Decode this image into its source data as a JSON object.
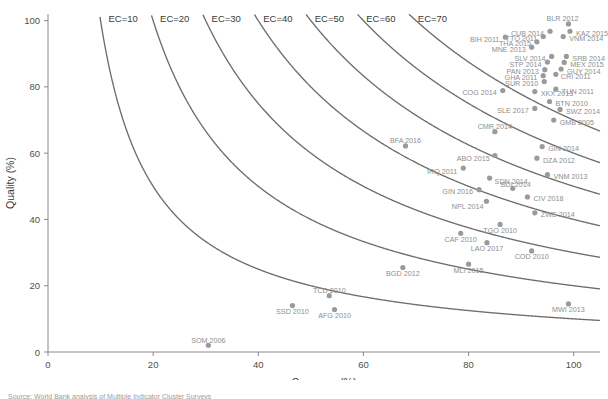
{
  "chart_data": {
    "type": "scatter",
    "title": "",
    "xlabel": "Coverage (%)",
    "ylabel": "Quality (%)",
    "xlim": [
      0,
      105
    ],
    "ylim": [
      0,
      102
    ],
    "xticks": [
      0,
      20,
      40,
      60,
      80,
      100
    ],
    "yticks": [
      0,
      20,
      40,
      60,
      80,
      100
    ],
    "grid": false,
    "legend": "none",
    "curves": {
      "label_prefix": "EC=",
      "formula": "Coverage * Quality = EC * 100",
      "levels": [
        10,
        20,
        30,
        40,
        50,
        60,
        70
      ],
      "labels": [
        "EC=10",
        "EC=20",
        "EC=30",
        "EC=40",
        "EC=50",
        "EC=60",
        "EC=70"
      ]
    },
    "points": [
      {
        "label": "BLR 2012",
        "x": 99.0,
        "y": 99.0,
        "lx": -6,
        "ly": -5,
        "anchor": "middle"
      },
      {
        "label": "KAZ 2015",
        "x": 99.3,
        "y": 96.8,
        "lx": 6,
        "ly": 2,
        "anchor": "start"
      },
      {
        "label": "CUB 2014",
        "x": 95.5,
        "y": 96.8,
        "lx": -6,
        "ly": 2,
        "anchor": "end"
      },
      {
        "label": "TTO 2011",
        "x": 94.2,
        "y": 95.2,
        "lx": -6,
        "ly": 2,
        "anchor": "end"
      },
      {
        "label": "THA 2015",
        "x": 93.0,
        "y": 93.6,
        "lx": -6,
        "ly": 2,
        "anchor": "end"
      },
      {
        "label": "VNM 2014",
        "x": 98.0,
        "y": 95.2,
        "lx": 6,
        "ly": 2,
        "anchor": "start"
      },
      {
        "label": "MNE 2013",
        "x": 92.0,
        "y": 92.0,
        "lx": -6,
        "ly": 2,
        "anchor": "end"
      },
      {
        "label": "BIH 2011",
        "x": 87.0,
        "y": 95.0,
        "lx": -6,
        "ly": 2,
        "anchor": "end"
      },
      {
        "label": "SLV 2014",
        "x": 95.8,
        "y": 89.2,
        "lx": -6,
        "ly": 2,
        "anchor": "end"
      },
      {
        "label": "SRB 2014",
        "x": 98.6,
        "y": 89.2,
        "lx": 6,
        "ly": 2,
        "anchor": "start"
      },
      {
        "label": "STP 2014",
        "x": 95.0,
        "y": 87.5,
        "lx": -6,
        "ly": 2,
        "anchor": "end"
      },
      {
        "label": "MEX 2015",
        "x": 98.2,
        "y": 87.4,
        "lx": 6,
        "ly": 2,
        "anchor": "start"
      },
      {
        "label": "PAN 2013",
        "x": 94.5,
        "y": 85.2,
        "lx": -6,
        "ly": 2,
        "anchor": "end"
      },
      {
        "label": "GUY 2014",
        "x": 97.6,
        "y": 85.4,
        "lx": 6,
        "ly": 2,
        "anchor": "start"
      },
      {
        "label": "GHA 2011",
        "x": 94.2,
        "y": 83.4,
        "lx": -6,
        "ly": 2,
        "anchor": "end"
      },
      {
        "label": "CRI 2011",
        "x": 96.6,
        "y": 83.8,
        "lx": 5,
        "ly": 2,
        "anchor": "start"
      },
      {
        "label": "SUR 2010",
        "x": 94.4,
        "y": 81.6,
        "lx": -6,
        "ly": 2,
        "anchor": "end"
      },
      {
        "label": "TUN 2011",
        "x": 96.6,
        "y": 79.3,
        "lx": 6,
        "ly": 2,
        "anchor": "start"
      },
      {
        "label": "COG 2014",
        "x": 86.5,
        "y": 78.9,
        "lx": -6,
        "ly": 2,
        "anchor": "end"
      },
      {
        "label": "XKX 2013",
        "x": 92.6,
        "y": 78.6,
        "lx": 6,
        "ly": 2,
        "anchor": "start"
      },
      {
        "label": "BTN 2010",
        "x": 95.4,
        "y": 75.6,
        "lx": 6,
        "ly": 2,
        "anchor": "start"
      },
      {
        "label": "SLE 2017",
        "x": 92.6,
        "y": 73.5,
        "lx": -6,
        "ly": 2,
        "anchor": "end"
      },
      {
        "label": "SWZ 2014",
        "x": 97.4,
        "y": 73.2,
        "lx": 6,
        "ly": 2,
        "anchor": "start"
      },
      {
        "label": "GMB 2005",
        "x": 96.2,
        "y": 70.0,
        "lx": 6,
        "ly": 2,
        "anchor": "start"
      },
      {
        "label": "CMR 2014",
        "x": 85.0,
        "y": 66.5,
        "lx": 0,
        "ly": -5,
        "anchor": "middle"
      },
      {
        "label": "GIN 2014",
        "x": 94.0,
        "y": 62.0,
        "lx": 6,
        "ly": 2,
        "anchor": "start"
      },
      {
        "label": "BFA 2016",
        "x": 68.0,
        "y": 62.2,
        "lx": 0,
        "ly": -5,
        "anchor": "middle"
      },
      {
        "label": "ABO 2015",
        "x": 85.0,
        "y": 59.3,
        "lx": -5,
        "ly": 3,
        "anchor": "end"
      },
      {
        "label": "DZA 2012",
        "x": 93.0,
        "y": 58.5,
        "lx": 6,
        "ly": 2,
        "anchor": "start"
      },
      {
        "label": "IRQ 2011",
        "x": 79.0,
        "y": 55.5,
        "lx": -6,
        "ly": 3,
        "anchor": "end"
      },
      {
        "label": "SDN 2014",
        "x": 84.0,
        "y": 52.5,
        "lx": 5,
        "ly": 3,
        "anchor": "start"
      },
      {
        "label": "VNM 2013",
        "x": 95.0,
        "y": 53.5,
        "lx": 6,
        "ly": 2,
        "anchor": "start"
      },
      {
        "label": "GIN 2016",
        "x": 82.0,
        "y": 49.0,
        "lx": -6,
        "ly": 2,
        "anchor": "end"
      },
      {
        "label": "BDI 2014",
        "x": 88.4,
        "y": 49.4,
        "lx": 3,
        "ly": -4,
        "anchor": "middle"
      },
      {
        "label": "CIV 2018",
        "x": 91.2,
        "y": 46.8,
        "lx": 6,
        "ly": 2,
        "anchor": "start"
      },
      {
        "label": "NPL 2014",
        "x": 83.4,
        "y": 45.5,
        "lx": -3,
        "ly": 5,
        "anchor": "end"
      },
      {
        "label": "ZWE 2014",
        "x": 92.6,
        "y": 42.0,
        "lx": 6,
        "ly": 2,
        "anchor": "start"
      },
      {
        "label": "TGO 2010",
        "x": 86.0,
        "y": 38.5,
        "lx": 0,
        "ly": 6,
        "anchor": "middle"
      },
      {
        "label": "CAF 2010",
        "x": 78.5,
        "y": 35.8,
        "lx": 0,
        "ly": 6,
        "anchor": "middle"
      },
      {
        "label": "LAO 2017",
        "x": 83.5,
        "y": 33.0,
        "lx": 0,
        "ly": 6,
        "anchor": "middle"
      },
      {
        "label": "COD 2010",
        "x": 92.0,
        "y": 30.5,
        "lx": 0,
        "ly": 6,
        "anchor": "middle"
      },
      {
        "label": "MLI 2015",
        "x": 80.0,
        "y": 26.5,
        "lx": 0,
        "ly": 6,
        "anchor": "middle"
      },
      {
        "label": "BGD 2012",
        "x": 67.5,
        "y": 25.5,
        "lx": 0,
        "ly": 6,
        "anchor": "middle"
      },
      {
        "label": "MWI 2013",
        "x": 99.0,
        "y": 14.5,
        "lx": 0,
        "ly": 6,
        "anchor": "middle"
      },
      {
        "label": "TCD 2010",
        "x": 53.5,
        "y": 17.0,
        "lx": 0,
        "ly": -5,
        "anchor": "middle"
      },
      {
        "label": "AFG 2010",
        "x": 54.5,
        "y": 12.8,
        "lx": 0,
        "ly": 6,
        "anchor": "middle"
      },
      {
        "label": "SSD 2010",
        "x": 46.5,
        "y": 14.0,
        "lx": 0,
        "ly": 6,
        "anchor": "middle"
      },
      {
        "label": "SOM 2006",
        "x": 30.5,
        "y": 2.0,
        "lx": 0,
        "ly": -5,
        "anchor": "middle"
      }
    ]
  },
  "footnote": {
    "text": "Source: World Bank analysis of Multiple Indicator Cluster Surveys"
  }
}
